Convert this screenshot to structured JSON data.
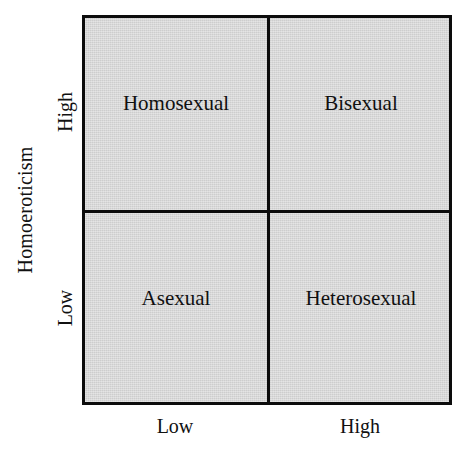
{
  "figure": {
    "type": "2x2-quadrant-matrix",
    "background_color": "#ffffff",
    "cell_fill_color": "#cdcdcd",
    "line_color": "#0c0c0c"
  },
  "axes": {
    "y": {
      "title": "Homoeroticism",
      "ticks": [
        {
          "label": "High",
          "position": "upper"
        },
        {
          "label": "Low",
          "position": "lower"
        }
      ]
    },
    "x": {
      "title": "",
      "ticks": [
        {
          "label": "Low",
          "position": "left"
        },
        {
          "label": "High",
          "position": "right"
        }
      ]
    }
  },
  "quadrants": [
    {
      "key": "top-left",
      "label": "Homosexual",
      "x": "Low",
      "y": "High"
    },
    {
      "key": "top-right",
      "label": "Bisexual",
      "x": "High",
      "y": "High"
    },
    {
      "key": "bottom-left",
      "label": "Asexual",
      "x": "Low",
      "y": "Low"
    },
    {
      "key": "bottom-right",
      "label": "Heterosexual",
      "x": "High",
      "y": "Low"
    }
  ],
  "chart_data": {
    "type": "table",
    "title": "",
    "xlabel": "",
    "ylabel": "Homoeroticism",
    "x_tick_labels": [
      "Low",
      "High"
    ],
    "y_tick_labels": [
      "Low",
      "High"
    ],
    "grid": true,
    "legend": "none",
    "categories": [
      "Low",
      "High"
    ],
    "cells": [
      {
        "row": "High",
        "col": "Low",
        "value": "Homosexual"
      },
      {
        "row": "High",
        "col": "High",
        "value": "Bisexual"
      },
      {
        "row": "Low",
        "col": "Low",
        "value": "Asexual"
      },
      {
        "row": "Low",
        "col": "High",
        "value": "Heterosexual"
      }
    ]
  }
}
